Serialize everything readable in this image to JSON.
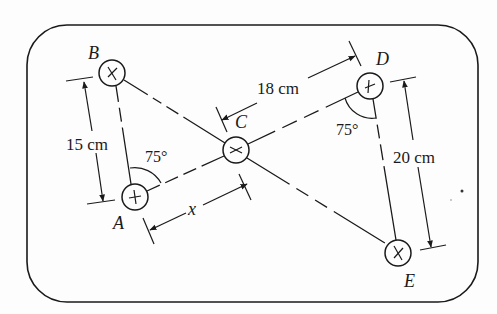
{
  "diagram": {
    "points": {
      "A": {
        "label": "A"
      },
      "B": {
        "label": "B"
      },
      "C": {
        "label": "C"
      },
      "D": {
        "label": "D"
      },
      "E": {
        "label": "E"
      }
    },
    "dimensions": {
      "AB": "15 cm",
      "CD": "18 cm",
      "DE": "20 cm",
      "AC": "x"
    },
    "angles": {
      "at_A": "75°",
      "at_D": "75°"
    },
    "colors": {
      "ink": "#1a1a1a",
      "background": "#fdfdfd"
    }
  }
}
